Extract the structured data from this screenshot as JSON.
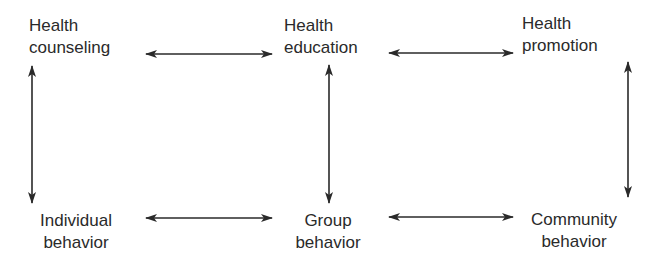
{
  "diagram": {
    "nodes": {
      "health_counseling": {
        "line1": "Health",
        "line2": "counseling"
      },
      "health_education": {
        "line1": "Health",
        "line2": "education"
      },
      "health_promotion": {
        "line1": "Health",
        "line2": "promotion"
      },
      "individual_behavior": {
        "line1": "Individual",
        "line2": "behavior"
      },
      "group_behavior": {
        "line1": "Group",
        "line2": "behavior"
      },
      "community_behavior": {
        "line1": "Community",
        "line2": "behavior"
      }
    },
    "edges": [
      {
        "from": "health_counseling",
        "to": "health_education",
        "type": "bidirectional"
      },
      {
        "from": "health_education",
        "to": "health_promotion",
        "type": "bidirectional"
      },
      {
        "from": "individual_behavior",
        "to": "group_behavior",
        "type": "bidirectional"
      },
      {
        "from": "group_behavior",
        "to": "community_behavior",
        "type": "bidirectional"
      },
      {
        "from": "health_counseling",
        "to": "individual_behavior",
        "type": "bidirectional"
      },
      {
        "from": "health_education",
        "to": "group_behavior",
        "type": "bidirectional"
      },
      {
        "from": "health_promotion",
        "to": "community_behavior",
        "type": "bidirectional"
      }
    ],
    "colors": {
      "arrow": "#2a2a2a",
      "text": "#2a2a2a",
      "background": "#ffffff"
    }
  }
}
